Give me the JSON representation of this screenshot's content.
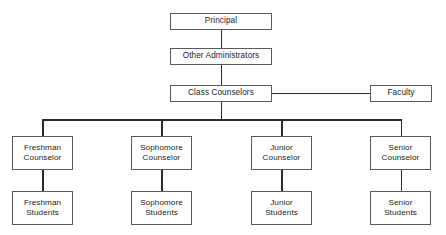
{
  "chart": {
    "type": "org-chart",
    "background_color": "#ffffff",
    "box_border_color": "#5a5a5a",
    "connector_color": "#2b2b2b",
    "text_color": "#1b1b1b"
  },
  "nodes": {
    "principal": {
      "label": "Principal"
    },
    "other_administrators": {
      "label": "Other Administrators"
    },
    "class_counselors": {
      "label": "Class Counselors"
    },
    "faculty": {
      "label": "Faculty"
    },
    "freshman_counselor": {
      "line1": "Freshman",
      "line2": "Counselor"
    },
    "sophomore_counselor": {
      "line1": "Sophomore",
      "line2": "Counselor"
    },
    "junior_counselor": {
      "line1": "Junior",
      "line2": "Counselor"
    },
    "senior_counselor": {
      "line1": "Senior",
      "line2": "Counselor"
    },
    "freshman_students": {
      "line1": "Freshman",
      "line2": "Students"
    },
    "sophomore_students": {
      "line1": "Sophomore",
      "line2": "Students"
    },
    "junior_students": {
      "line1": "Junior",
      "line2": "Students"
    },
    "senior_students": {
      "line1": "Senior",
      "line2": "Students"
    }
  },
  "hierarchy": {
    "root": "Principal",
    "levels": [
      [
        "Principal"
      ],
      [
        "Other Administrators"
      ],
      [
        "Class Counselors",
        "Faculty"
      ],
      [
        "Freshman Counselor",
        "Sophomore Counselor",
        "Junior Counselor",
        "Senior Counselor"
      ],
      [
        "Freshman Students",
        "Sophomore Students",
        "Junior Students",
        "Senior Students"
      ]
    ],
    "edges": [
      [
        "Principal",
        "Other Administrators"
      ],
      [
        "Other Administrators",
        "Class Counselors"
      ],
      [
        "Class Counselors",
        "Faculty"
      ],
      [
        "Class Counselors",
        "Freshman Counselor"
      ],
      [
        "Class Counselors",
        "Sophomore Counselor"
      ],
      [
        "Class Counselors",
        "Junior Counselor"
      ],
      [
        "Class Counselors",
        "Senior Counselor"
      ],
      [
        "Freshman Counselor",
        "Freshman Students"
      ],
      [
        "Sophomore Counselor",
        "Sophomore Students"
      ],
      [
        "Junior Counselor",
        "Junior Students"
      ],
      [
        "Senior Counselor",
        "Senior Students"
      ]
    ]
  }
}
